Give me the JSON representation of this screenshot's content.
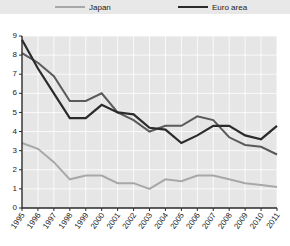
{
  "chart_data": {
    "type": "line",
    "title": "",
    "subtitle": "",
    "xlabel": "",
    "ylabel": "",
    "ylim": [
      0,
      9
    ],
    "yticks": [
      0,
      1,
      2,
      3,
      4,
      5,
      6,
      7,
      8,
      9
    ],
    "grid": true,
    "legend_position": "top",
    "x": [
      1995,
      1996,
      1997,
      1998,
      1999,
      2000,
      2001,
      2002,
      2003,
      2004,
      2005,
      2006,
      2007,
      2008,
      2009,
      2010,
      2011
    ],
    "categories": [
      "1995",
      "1996",
      "1997",
      "1998",
      "1999",
      "2000",
      "2001",
      "2002",
      "2003",
      "2004",
      "2005",
      "2006",
      "2007",
      "2008",
      "2009",
      "2010",
      "2011"
    ],
    "series": [
      {
        "name": "United States",
        "color": "#5a5a5a",
        "width": 2.0,
        "legend_visible": false,
        "values": [
          8.1,
          7.6,
          6.9,
          5.6,
          5.6,
          6.0,
          5.0,
          4.6,
          4.0,
          4.3,
          4.3,
          4.8,
          4.6,
          3.7,
          3.3,
          3.2,
          2.8
        ]
      },
      {
        "name": "Japan",
        "color": "#a8a8a8",
        "width": 2.0,
        "legend_visible": true,
        "values": [
          3.4,
          3.1,
          2.4,
          1.5,
          1.7,
          1.7,
          1.3,
          1.3,
          1.0,
          1.5,
          1.4,
          1.7,
          1.7,
          1.5,
          1.3,
          1.2,
          1.1
        ]
      },
      {
        "name": "Euro area",
        "color": "#2b2b2b",
        "width": 2.2,
        "legend_visible": true,
        "values": [
          8.8,
          7.3,
          6.0,
          4.7,
          4.7,
          5.4,
          5.0,
          4.9,
          4.2,
          4.1,
          3.4,
          3.8,
          4.3,
          4.3,
          3.8,
          3.6,
          4.3
        ]
      }
    ]
  },
  "legend": {
    "items": [
      {
        "label": "Japan",
        "color": "#a8a8a8"
      },
      {
        "label": "Euro area",
        "color": "#2b2b2b"
      }
    ]
  },
  "axes": {
    "y_labels": [
      "9",
      "8",
      "7",
      "6",
      "5",
      "4",
      "3",
      "2",
      "1",
      "0"
    ],
    "x_labels": [
      "1995",
      "1996",
      "1997",
      "1998",
      "1999",
      "2000",
      "2001",
      "2002",
      "2003",
      "2004",
      "2005",
      "2006",
      "2007",
      "2008",
      "2009",
      "2010",
      "2011"
    ]
  },
  "colors": {
    "plot_background": "#e6e6e6",
    "legend_background": "#e8e8e8",
    "axis": "#2b2b2b",
    "gridline": "#ffffff",
    "page_background": "#ffffff"
  }
}
